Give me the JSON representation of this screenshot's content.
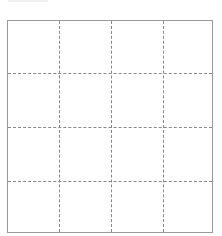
{
  "grid": {
    "rows": 4,
    "columns": 4,
    "line_style": "dashed",
    "border_color": "#9a9a9a",
    "line_color": "#8a8a8a",
    "background": "#ffffff"
  }
}
